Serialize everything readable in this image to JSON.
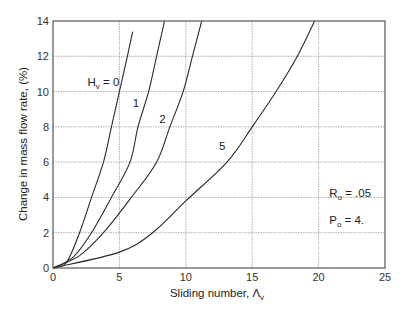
{
  "chart_data": {
    "type": "line",
    "title": "",
    "xlabel": "Sliding number, Λ_v",
    "xlabel_main": "Sliding number, ",
    "xlabel_symbol": "Λ",
    "xlabel_sub": "v",
    "ylabel": "Change in mass flow rate, (%)",
    "xlim": [
      0,
      25
    ],
    "ylim": [
      0,
      14
    ],
    "xticks": [
      0,
      5,
      10,
      15,
      20,
      25
    ],
    "yticks": [
      0,
      2,
      4,
      6,
      8,
      10,
      12,
      14
    ],
    "grid": true,
    "legend": "inline curve labels",
    "series": [
      {
        "name": "H_v = 0",
        "label": "0",
        "x": [
          0,
          1,
          2,
          2.9,
          3.8,
          4.4,
          5.0,
          5.6,
          6.0
        ],
        "y": [
          0,
          0.3,
          2,
          4,
          6,
          8,
          10,
          12,
          13.4
        ]
      },
      {
        "name": "H_v = 1",
        "label": "1",
        "x": [
          0,
          1.5,
          2.9,
          4.4,
          5.8,
          6.4,
          7.2,
          7.8,
          8.4
        ],
        "y": [
          0,
          0.6,
          2,
          4,
          6,
          8,
          10,
          12,
          14
        ]
      },
      {
        "name": "H_v = 2",
        "label": "2",
        "x": [
          0,
          2,
          3.8,
          5.9,
          7.8,
          8.8,
          9.8,
          10.5,
          11.2
        ],
        "y": [
          0,
          0.7,
          2,
          4,
          6,
          8,
          10,
          12,
          14
        ]
      },
      {
        "name": "H_v = 5",
        "label": "5",
        "x": [
          0,
          5,
          7.5,
          10,
          13.1,
          15,
          16.8,
          18.4,
          19.7
        ],
        "y": [
          0,
          0.9,
          2,
          3.8,
          6,
          8,
          10,
          12,
          14
        ]
      }
    ],
    "annotations": [
      {
        "text": "H_v = 0",
        "main": "H",
        "sub": "v",
        "rest": " = 0",
        "x": 2.6,
        "y": 10.3
      },
      {
        "text": "1",
        "x": 6.0,
        "y": 9.1
      },
      {
        "text": "2",
        "x": 8.0,
        "y": 8.2
      },
      {
        "text": "5",
        "x": 12.5,
        "y": 6.7
      },
      {
        "text": "R_o = .05",
        "main": "R",
        "sub": "o",
        "rest": " = .05",
        "x": 20.8,
        "y": 4.0
      },
      {
        "text": "P_o = 4.",
        "main": "P",
        "sub": "o",
        "rest": " = 4.",
        "x": 20.8,
        "y": 2.5
      }
    ]
  }
}
